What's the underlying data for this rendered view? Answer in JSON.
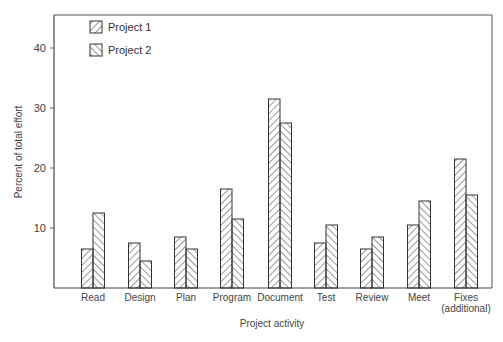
{
  "chart_data": {
    "type": "bar",
    "title": "",
    "xlabel": "Project activity",
    "ylabel": "Percent of total effort",
    "ylim": [
      0,
      45
    ],
    "yticks": [
      10,
      20,
      30,
      40
    ],
    "grid": false,
    "legend_position": "top-left inside",
    "categories": [
      "Read",
      "Design",
      "Plan",
      "Program",
      "Document",
      "Test",
      "Review",
      "Meet",
      "Fixes\n(additional)"
    ],
    "series": [
      {
        "name": "Project 1",
        "pattern": "back-diagonal hatch",
        "values": [
          6.5,
          7.5,
          8.5,
          16.5,
          31.5,
          7.5,
          6.5,
          10.5,
          21.5
        ]
      },
      {
        "name": "Project 2",
        "pattern": "forward-diagonal hatch",
        "values": [
          12.5,
          4.5,
          6.5,
          11.5,
          27.5,
          10.5,
          8.5,
          14.5,
          15.5
        ]
      }
    ]
  },
  "colors": {
    "ink": "#333333",
    "background": "#ffffff"
  }
}
